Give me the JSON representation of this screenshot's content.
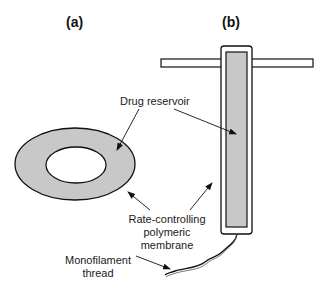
{
  "panels": {
    "a": {
      "label": "(a)"
    },
    "b": {
      "label": "(b)"
    }
  },
  "annotations": {
    "drug_reservoir": "Drug reservoir",
    "membrane_line1": "Rate-controlling",
    "membrane_line2": "polymeric",
    "membrane_line3": "membrane",
    "thread_line1": "Monofilament",
    "thread_line2": "thread"
  },
  "colors": {
    "fill_gray": "#c8c8c8",
    "stroke": "#111111"
  }
}
